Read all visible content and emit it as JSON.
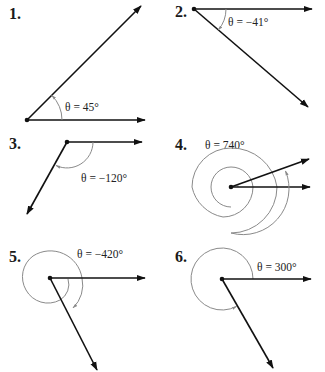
{
  "figure": {
    "panels": [
      {
        "number": "1.",
        "label": "θ = 45°",
        "angle_deg": 45
      },
      {
        "number": "2.",
        "label": "θ = −41°",
        "angle_deg": -41
      },
      {
        "number": "3.",
        "label": "θ = −120°",
        "angle_deg": -120
      },
      {
        "number": "4.",
        "label": "θ = 740°",
        "angle_deg": 740
      },
      {
        "number": "5.",
        "label": "θ = −420°",
        "angle_deg": -420
      },
      {
        "number": "6.",
        "label": "θ = 300°",
        "angle_deg": 300
      }
    ],
    "colors": {
      "ray": "#111111",
      "arc": "#8a8a8a",
      "text": "#1a1a1a"
    }
  }
}
